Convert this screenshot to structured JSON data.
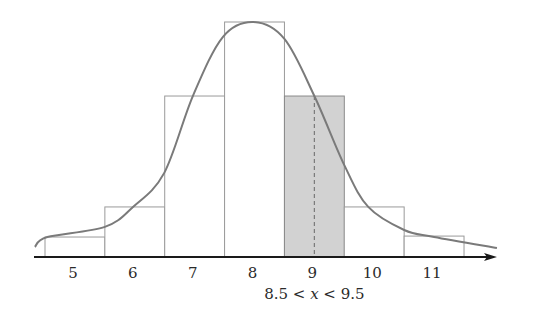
{
  "chart_data": {
    "type": "bar",
    "title": "",
    "xlabel": "",
    "ylabel": "",
    "grid": false,
    "legend": "none",
    "categories": [
      "5",
      "6",
      "7",
      "8",
      "9",
      "10",
      "11"
    ],
    "x": [
      5,
      6,
      7,
      8,
      9,
      10,
      11
    ],
    "bin_width": 1,
    "values": [
      0.085,
      0.213,
      0.685,
      1.0,
      0.685,
      0.213,
      0.089
    ],
    "value_units": "relative height (peak = 1)",
    "xlim": [
      4.33,
      12.05
    ],
    "ylim": [
      0,
      1.0
    ],
    "highlighted_bar": {
      "category": "9",
      "interval": [
        8.5,
        9.5
      ],
      "color": "#d2d2d2",
      "marker_x": 9,
      "marker_style": "dashed"
    },
    "curve": {
      "name": "density curve",
      "points": [
        [
          4.33,
          0.043
        ],
        [
          4.54,
          0.085
        ],
        [
          5.5,
          0.128
        ],
        [
          5.97,
          0.213
        ],
        [
          6.49,
          0.357
        ],
        [
          6.97,
          0.685
        ],
        [
          7.47,
          0.936
        ],
        [
          7.98,
          1.0
        ],
        [
          8.5,
          0.928
        ],
        [
          9.0,
          0.685
        ],
        [
          9.5,
          0.391
        ],
        [
          9.9,
          0.213
        ],
        [
          10.5,
          0.115
        ],
        [
          11.0,
          0.085
        ],
        [
          12.05,
          0.038
        ]
      ]
    },
    "tick_labels": [
      "5",
      "6",
      "7",
      "8",
      "9",
      "10",
      "11"
    ],
    "annotations": [
      {
        "x": 9,
        "text_parts": [
          "8.5 < ",
          "x",
          " < 9.5"
        ],
        "position": "below-axis"
      }
    ],
    "colors": {
      "bar_fill": "#ffffff",
      "bar_stroke": "#9a9a9a",
      "highlight_fill": "#d2d2d2",
      "curve": "#7a7a7a",
      "axis": "#1a1a1a"
    }
  }
}
